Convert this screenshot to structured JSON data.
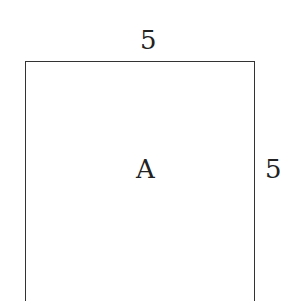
{
  "diagram": {
    "shape": "square",
    "region_label": "A",
    "top_side_length": "5",
    "right_side_length": "5"
  }
}
